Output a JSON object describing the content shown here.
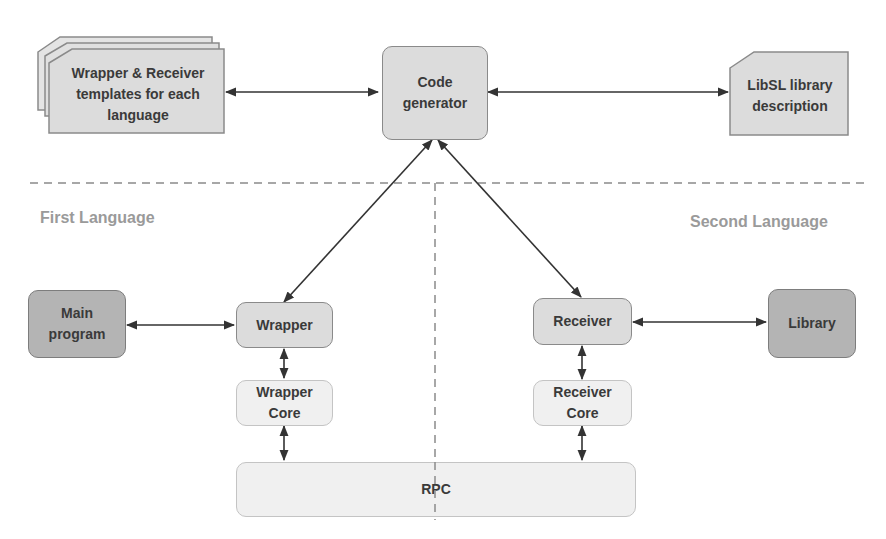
{
  "diagram": {
    "top": {
      "templates": {
        "label": "Wrapper & Receiver templates for each language"
      },
      "code_generator": {
        "label": "Code generator"
      },
      "libsl_description": {
        "label": "LibSL library description"
      }
    },
    "sections": {
      "left": "First Language",
      "right": "Second Language"
    },
    "left": {
      "main_program": {
        "label": "Main program"
      },
      "wrapper": {
        "label": "Wrapper"
      },
      "wrapper_core": {
        "label": "Wrapper Core"
      }
    },
    "right": {
      "receiver": {
        "label": "Receiver"
      },
      "library": {
        "label": "Library"
      },
      "receiver_core": {
        "label": "Receiver Core"
      }
    },
    "bottom": {
      "rpc": {
        "label": "RPC"
      }
    },
    "colors": {
      "box_mid": "#dcdcdc",
      "box_dark": "#b4b4b4",
      "box_light": "#f0f0f0",
      "arrow": "#333333",
      "dashed_line": "#8a8a8a",
      "section_label": "#9a9a9a"
    },
    "connections": [
      {
        "from": "templates",
        "to": "code_generator",
        "type": "bidirectional"
      },
      {
        "from": "code_generator",
        "to": "libsl_description",
        "type": "bidirectional"
      },
      {
        "from": "code_generator",
        "to": "wrapper",
        "type": "bidirectional"
      },
      {
        "from": "code_generator",
        "to": "receiver",
        "type": "bidirectional"
      },
      {
        "from": "main_program",
        "to": "wrapper",
        "type": "bidirectional"
      },
      {
        "from": "receiver",
        "to": "library",
        "type": "bidirectional"
      },
      {
        "from": "wrapper",
        "to": "wrapper_core",
        "type": "bidirectional"
      },
      {
        "from": "receiver",
        "to": "receiver_core",
        "type": "bidirectional"
      },
      {
        "from": "wrapper_core",
        "to": "rpc",
        "type": "bidirectional"
      },
      {
        "from": "receiver_core",
        "to": "rpc",
        "type": "bidirectional"
      }
    ]
  }
}
